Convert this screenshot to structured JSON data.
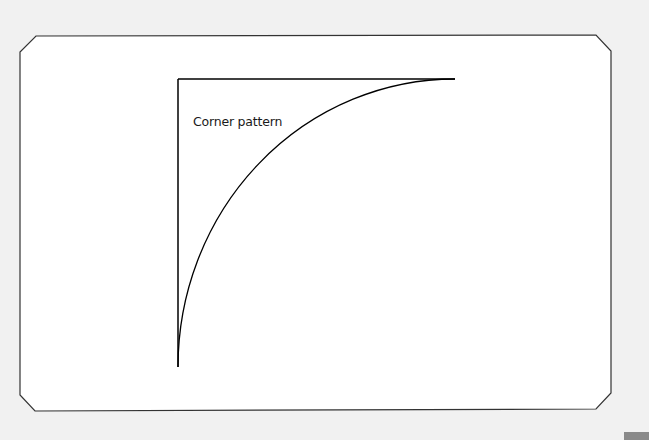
{
  "diagram": {
    "label": "Corner pattern",
    "card": {
      "fill": "#ffffff",
      "stroke": "#333333",
      "points": "36,36 596,35 611,51 611,393 596,409 35,411 20,395 20,52"
    },
    "pattern": {
      "stroke": "#000000",
      "horizontal_line": {
        "x1": 178,
        "y1": 79,
        "x2": 455,
        "y2": 79
      },
      "vertical_line": {
        "x1": 178,
        "y1": 79,
        "x2": 178,
        "y2": 367
      },
      "arc_path": "M 178 367 A 277 288 0 0 1 455 79"
    }
  }
}
